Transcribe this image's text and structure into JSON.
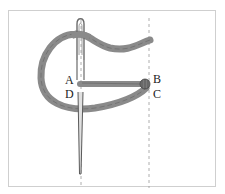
{
  "figure": {
    "labels": {
      "a": "A",
      "b": "B",
      "c": "C",
      "d": "D"
    },
    "colors": {
      "thread": "#8a8a8a",
      "thread_dark": "#5e5e5e",
      "needle": "#6b6b6b",
      "guide_line": "#9a9a9a",
      "frame": "#cfcfcf"
    }
  }
}
